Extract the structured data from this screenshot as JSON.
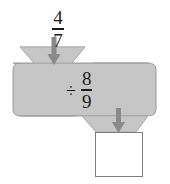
{
  "diagram": {
    "type": "function-machine",
    "background_color": "#ffffff",
    "machine": {
      "body_fill": "#c6c6c6",
      "body_stroke": "#9a9a9a",
      "hopper_fill": "#c6c6c6",
      "arrow_color": "#8a8a8a",
      "ink_color": "#1a1a1a"
    },
    "input": {
      "label": "4/7",
      "numerator": "4",
      "denominator": "7"
    },
    "operation": {
      "symbol": "÷",
      "operand_numerator": "8",
      "operand_denominator": "9",
      "label": "÷ 8/9"
    },
    "output": {
      "value": "",
      "placeholder": ""
    },
    "arrows": {
      "input_arrow_name": "down-arrow",
      "output_arrow_name": "down-arrow"
    }
  }
}
